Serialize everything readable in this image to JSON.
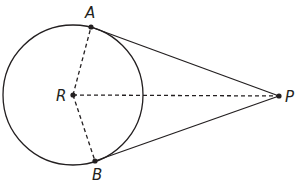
{
  "diagram": {
    "type": "geometry",
    "colors": {
      "stroke": "#231f20",
      "background": "#ffffff"
    },
    "circle": {
      "center": "R",
      "cx": 73,
      "cy": 95,
      "r": 70
    },
    "points": [
      {
        "name": "A",
        "label": "A",
        "x": 91,
        "y": 27
      },
      {
        "name": "B",
        "label": "B",
        "x": 95,
        "y": 161
      },
      {
        "name": "R",
        "label": "R",
        "x": 73,
        "y": 95
      },
      {
        "name": "P",
        "label": "P",
        "x": 279,
        "y": 96
      }
    ],
    "segments": [
      {
        "from": "A",
        "to": "P",
        "style": "solid"
      },
      {
        "from": "B",
        "to": "P",
        "style": "solid"
      },
      {
        "from": "R",
        "to": "A",
        "style": "dashed"
      },
      {
        "from": "R",
        "to": "B",
        "style": "dashed"
      },
      {
        "from": "R",
        "to": "P",
        "style": "dashed"
      }
    ],
    "labels": {
      "A": "A",
      "B": "B",
      "R": "R",
      "P": "P"
    }
  }
}
